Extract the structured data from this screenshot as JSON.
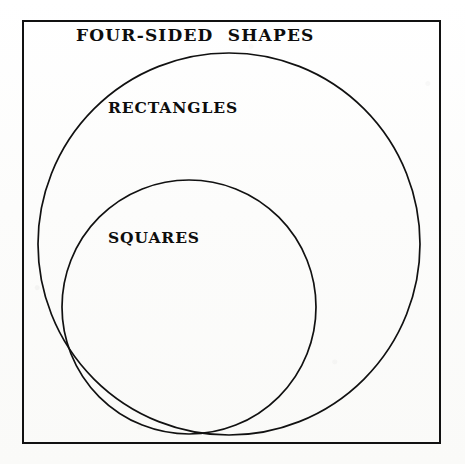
{
  "figure": {
    "type": "euler-diagram",
    "background_color": "#fdfdfc",
    "ink_color": "#111111",
    "boundary": {
      "name": "universe-rectangle",
      "shape": "rectangle",
      "label_ref": "labels.universe",
      "x": 23,
      "y": 21,
      "width": 417,
      "height": 422,
      "stroke_width": 2.6,
      "fill": "none"
    },
    "sets": [
      {
        "name": "rectangles-circle",
        "shape": "circle",
        "label_ref": "labels.rectangles",
        "cx": 229,
        "cy": 244,
        "r": 191,
        "stroke_width": 1.7,
        "fill": "none"
      },
      {
        "name": "squares-circle",
        "shape": "circle",
        "label_ref": "labels.squares",
        "cx": 189,
        "cy": 307,
        "r": 127,
        "stroke_width": 1.7,
        "fill": "none"
      }
    ],
    "containment": [
      "squares ⊂ rectangles",
      "rectangles ⊂ four-sided shapes"
    ]
  },
  "labels": {
    "universe": "FOUR-SIDED  SHAPES",
    "rectangles": "RECTANGLES",
    "squares": "SQUARES"
  }
}
